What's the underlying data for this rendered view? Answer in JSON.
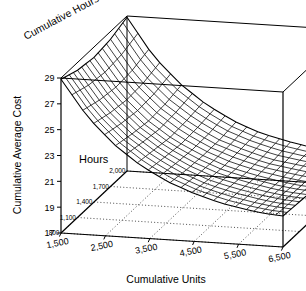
{
  "chart_data": {
    "type": "surface",
    "title": "",
    "xlabel": "Cumulative Units",
    "ylabel": "Cumulative Average Cost",
    "zlabel": "Cumulative Hours",
    "depth_legend": "Hours",
    "x_ticks": [
      "1,500",
      "2,500",
      "3,500",
      "4,500",
      "5,500",
      "6,500"
    ],
    "x_values": [
      1500,
      2500,
      3500,
      4500,
      5500,
      6500
    ],
    "xlim": [
      1500,
      6500
    ],
    "y_ticks": [
      "17",
      "19",
      "21",
      "23",
      "25",
      "27",
      "29"
    ],
    "y_values": [
      17,
      19,
      21,
      23,
      25,
      27,
      29
    ],
    "ylim": [
      17,
      29
    ],
    "depth_ticks": [
      "800",
      "1,100",
      "1,400",
      "1,700",
      "2,000"
    ],
    "depth_values": [
      800,
      1100,
      1400,
      1700,
      2000
    ],
    "zlim": [
      800,
      2000
    ],
    "grid": "dotted-floor",
    "legend_position": "inside-left",
    "colors": {
      "line": "#000000",
      "background": "#ffffff",
      "grid": "#000000"
    },
    "x": [
      1500,
      2100,
      2700,
      3300,
      3900,
      4500,
      5100,
      5700,
      6100,
      6500
    ],
    "z": [
      800,
      1100,
      1400,
      1700,
      2000
    ],
    "series": [
      {
        "name": "800",
        "values": [
          28.9,
          26.1,
          24.1,
          22.6,
          21.5,
          20.7,
          20.1,
          19.7,
          19.5,
          19.4
        ]
      },
      {
        "name": "1,100",
        "values": [
          28.4,
          25.7,
          23.8,
          22.4,
          21.3,
          20.5,
          20.0,
          19.6,
          19.4,
          19.3
        ]
      },
      {
        "name": "1,400",
        "values": [
          28.2,
          25.5,
          23.6,
          22.2,
          21.2,
          20.4,
          19.9,
          19.5,
          19.3,
          19.2
        ]
      },
      {
        "name": "1,700",
        "values": [
          28.4,
          25.6,
          23.7,
          22.3,
          21.2,
          20.5,
          19.9,
          19.6,
          19.4,
          19.3
        ]
      },
      {
        "name": "2,000",
        "values": [
          28.9,
          26.0,
          24.0,
          22.5,
          21.4,
          20.6,
          20.1,
          19.7,
          19.5,
          19.4
        ]
      }
    ]
  }
}
